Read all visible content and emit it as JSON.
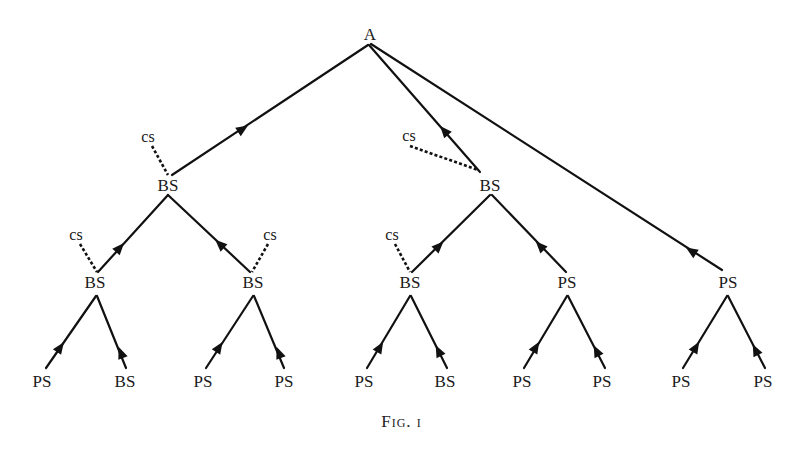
{
  "figure": {
    "caption": "Fig. i",
    "root": {
      "label": "A"
    },
    "level1": [
      {
        "label": "BS",
        "cs": "cs"
      },
      {
        "label": "BS",
        "cs": "cs"
      },
      {
        "label": "PS"
      }
    ],
    "level2": [
      {
        "label": "BS",
        "cs": "cs"
      },
      {
        "label": "BS",
        "cs": "cs"
      },
      {
        "label": "BS",
        "cs": "cs"
      },
      {
        "label": "PS"
      }
    ],
    "leaves": [
      "PS",
      "BS",
      "PS",
      "PS",
      "PS",
      "BS",
      "PS",
      "PS",
      "PS",
      "PS"
    ],
    "edge_style": {
      "solid": "child-to-parent arrow",
      "dashed": "cs link"
    }
  }
}
